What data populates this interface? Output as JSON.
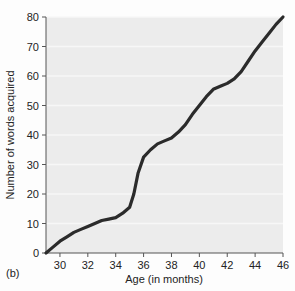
{
  "figure": {
    "panel_label": "(b)",
    "background_color": "#fdfdfd",
    "plot_background_color": "#ececec",
    "line_color": "#2b2b2b",
    "gridline_color": "#f7f7f7",
    "axis_color": "#555555"
  },
  "chart_data": {
    "type": "line",
    "title": "",
    "xlabel": "Age (in months)",
    "ylabel": "Number of words acquired",
    "xlim": [
      29,
      46
    ],
    "ylim": [
      0,
      80
    ],
    "xticks": [
      30,
      32,
      34,
      36,
      38,
      40,
      42,
      44,
      46
    ],
    "yticks": [
      0,
      10,
      20,
      30,
      40,
      50,
      60,
      70,
      80
    ],
    "xtick_labels": [
      "30",
      "32",
      "34",
      "36",
      "38",
      "40",
      "42",
      "44",
      "46"
    ],
    "ytick_labels": [
      "0",
      "10",
      "20",
      "30",
      "40",
      "50",
      "60",
      "70",
      "80"
    ],
    "grid": true,
    "legend": false,
    "series": [
      {
        "name": "Words acquired",
        "x": [
          29.0,
          29.5,
          30.0,
          30.5,
          31.0,
          31.5,
          32.0,
          32.5,
          33.0,
          33.5,
          34.0,
          34.5,
          35.0,
          35.3,
          35.6,
          36.0,
          36.5,
          37.0,
          37.5,
          38.0,
          38.5,
          39.0,
          39.5,
          40.0,
          40.5,
          41.0,
          41.5,
          42.0,
          42.5,
          43.0,
          43.5,
          44.0,
          44.5,
          45.0,
          45.5,
          46.0
        ],
        "y": [
          0,
          2,
          4,
          5.5,
          7,
          8,
          9,
          10,
          11,
          11.5,
          12,
          13.5,
          15.5,
          20,
          27,
          32.5,
          35,
          37,
          38,
          39,
          41,
          43.5,
          47,
          50,
          53,
          55.5,
          56.5,
          57.5,
          59,
          61.5,
          65,
          68.5,
          71.5,
          74.5,
          77.5,
          80
        ]
      }
    ]
  }
}
